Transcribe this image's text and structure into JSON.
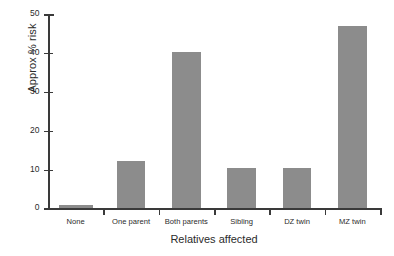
{
  "chart_data": {
    "type": "bar",
    "title": "",
    "xlabel": "Relatives affected",
    "ylabel": "Approx % risk",
    "categories": [
      "None",
      "One parent",
      "Both parents",
      "Sibling",
      "DZ twin",
      "MZ twin"
    ],
    "values": [
      1.0,
      12.2,
      40.3,
      10.3,
      10.3,
      47.0
    ],
    "ylim": [
      0,
      50
    ],
    "yticks": [
      0,
      10,
      20,
      30,
      40,
      50
    ],
    "ytick_labels": [
      "0",
      "10",
      "20",
      "30",
      "40",
      "50"
    ],
    "grid": false,
    "legend": null,
    "bar_color": "#8c8c8c",
    "axis_color": "#3a3a3a",
    "background": "#ffffff"
  }
}
